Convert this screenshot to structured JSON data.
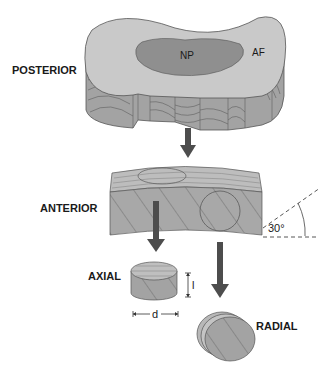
{
  "diagram": {
    "labels": {
      "posterior": "POSTERIOR",
      "anterior": "ANTERIOR",
      "axial": "AXIAL",
      "radial": "RADIAL",
      "np": "NP",
      "af": "AF",
      "angle": "30°",
      "thickness": "l",
      "diameter": "d"
    },
    "colors": {
      "top_surface": "#c9c9c9",
      "nucleus": "#8f8f8f",
      "side_wall": "#a3a3a3",
      "lines": "#5a5a5a",
      "arrow": "#4d4d4d",
      "block_face": "#a8a8a8",
      "block_top": "#bdbdbd"
    }
  }
}
